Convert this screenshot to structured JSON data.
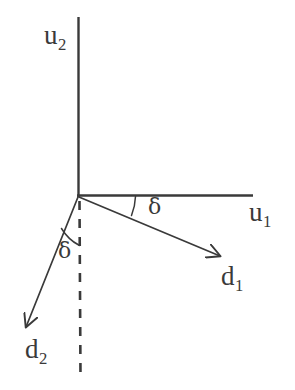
{
  "figure": {
    "kind": "vector-diagram",
    "background_color": "#ffffff",
    "ink_color": "#3a3a3a",
    "width": 295,
    "height": 390,
    "origin": {
      "x": 78,
      "y": 196
    }
  },
  "axes": {
    "vertical": {
      "name": "u2",
      "label_text": "u",
      "label_subscript": "2",
      "from": {
        "x": 78,
        "y": 17
      },
      "to": {
        "x": 78,
        "y": 196
      },
      "style": "solid"
    },
    "horizontal": {
      "name": "u1",
      "label_text": "u",
      "label_subscript": "1",
      "from": {
        "x": 78,
        "y": 195
      },
      "to": {
        "x": 253,
        "y": 195
      },
      "style": "solid"
    }
  },
  "reference_line": {
    "name": "vertical-dashed-reference",
    "from": {
      "x": 79,
      "y": 200
    },
    "to": {
      "x": 80,
      "y": 378
    },
    "style": "dashed",
    "dash_pattern": "9 9"
  },
  "vectors": [
    {
      "name": "d1",
      "label_text": "d",
      "label_subscript": "1",
      "from": {
        "x": 78,
        "y": 196
      },
      "to": {
        "x": 225,
        "y": 258
      },
      "angle_from_horizontal_deg": 22.9,
      "arrowhead": true
    },
    {
      "name": "d2",
      "label_text": "d",
      "label_subscript": "2",
      "from": {
        "x": 78,
        "y": 196
      },
      "to": {
        "x": 21,
        "y": 334
      },
      "angle_from_vertical_deg": 22.4,
      "arrowhead": true
    }
  ],
  "angles": [
    {
      "name": "delta-between-u1-and-d1",
      "symbol": "δ",
      "arc": {
        "radius": 58,
        "start_deg": 0,
        "end_deg": 22.9
      }
    },
    {
      "name": "delta-between-dashed-and-d2",
      "symbol": "δ",
      "arc": {
        "radius": 48,
        "start_deg": 90,
        "end_deg": 112.4
      }
    }
  ]
}
